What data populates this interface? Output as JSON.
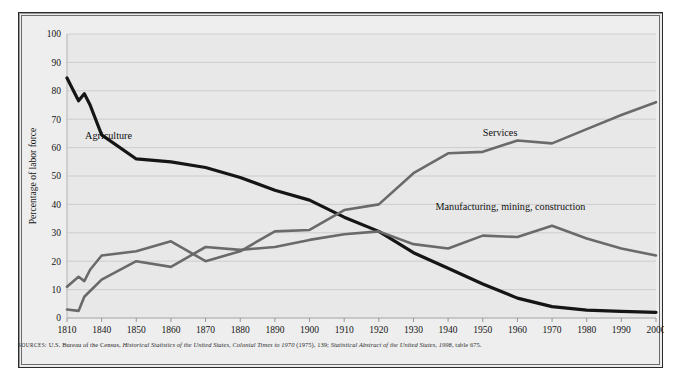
{
  "figure": {
    "background_color": "#ececec",
    "plot_background_color": "#e8e8e8",
    "border_color": "#2b2b2b",
    "gridline_color": "#c9c9c9"
  },
  "source_note": {
    "label": "SOURCES:",
    "part1": "U.S. Bureau of the Census,",
    "italic1": "Historical Statistics of the United States, Colonial Times to 1970",
    "part2": "(1975), 139;",
    "italic2": "Statistical Abstract of the United States, 1998",
    "part3": ", table 675."
  },
  "chart_data": {
    "type": "line",
    "title": "",
    "xlabel": "",
    "ylabel": "Percentage of labor force",
    "ylim": [
      0,
      100
    ],
    "ytick_step": 10,
    "yticks": [
      0,
      10,
      20,
      30,
      40,
      50,
      60,
      70,
      80,
      90,
      100
    ],
    "xlim": [
      1810,
      2000
    ],
    "xticks": [
      1810,
      1840,
      1850,
      1860,
      1870,
      1880,
      1890,
      1900,
      1910,
      1920,
      1930,
      1940,
      1950,
      1960,
      1970,
      1980,
      1990,
      2000
    ],
    "xtick_labels": [
      "1810",
      "1840",
      "1850",
      "1860",
      "1870",
      "1880",
      "1890",
      "1900",
      "1910",
      "1920",
      "1930",
      "1940",
      "1950",
      "1960",
      "1970",
      "1980",
      "1990",
      "2000"
    ],
    "x_axis_note": "categorical-even spacing; 1810 then decade ticks from 1840",
    "grid": "horizontal",
    "legend_position": "inline-annotations",
    "series": [
      {
        "name": "Agriculture",
        "color": "#151515",
        "width": 3.2,
        "label_x": 1842,
        "label_y": 63,
        "x": [
          1810,
          1820,
          1825,
          1830,
          1840,
          1850,
          1860,
          1870,
          1880,
          1890,
          1900,
          1910,
          1920,
          1930,
          1940,
          1950,
          1960,
          1970,
          1980,
          1990,
          2000
        ],
        "y": [
          84.5,
          76.5,
          79,
          75,
          64.5,
          56,
          55,
          53,
          49.5,
          45,
          41.5,
          35.5,
          30.5,
          23,
          17.5,
          12,
          7,
          4,
          2.8,
          2.3,
          2
        ]
      },
      {
        "name": "Services",
        "color": "#6a6a6a",
        "width": 2.6,
        "label_x": 1955,
        "label_y": 64,
        "x": [
          1810,
          1820,
          1825,
          1830,
          1840,
          1850,
          1860,
          1870,
          1880,
          1890,
          1900,
          1910,
          1920,
          1930,
          1940,
          1950,
          1960,
          1970,
          1980,
          1990,
          2000
        ],
        "y": [
          11,
          14.5,
          13,
          17,
          22,
          23.5,
          27,
          20,
          23.5,
          30.5,
          31,
          38,
          40,
          51,
          58,
          58.5,
          62.5,
          61.5,
          66.5,
          71.5,
          76
        ]
      },
      {
        "name": "Manufacturing, mining, construction",
        "color": "#6a6a6a",
        "width": 2.6,
        "label_x": 1958,
        "label_y": 38,
        "x": [
          1810,
          1820,
          1825,
          1830,
          1840,
          1850,
          1860,
          1870,
          1880,
          1890,
          1900,
          1910,
          1920,
          1930,
          1940,
          1950,
          1960,
          1970,
          1980,
          1990,
          2000
        ],
        "y": [
          3,
          2.5,
          7.5,
          9.5,
          13.5,
          20,
          18,
          25,
          24,
          25,
          27.5,
          29.5,
          30.5,
          26,
          24.5,
          29,
          28.5,
          32.5,
          28,
          24.5,
          22
        ]
      }
    ]
  }
}
